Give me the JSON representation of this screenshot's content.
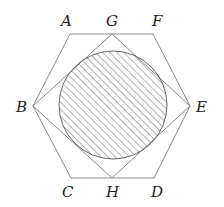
{
  "diagram": {
    "type": "geometry",
    "colors": {
      "line": "#8a8a8a",
      "circle_stroke": "#666666",
      "hatch": "#555555",
      "label": "#222222"
    },
    "points": {
      "A": {
        "label": "A",
        "x": 70,
        "y": 34
      },
      "G": {
        "label": "G",
        "x": 112,
        "y": 34
      },
      "F": {
        "label": "F",
        "x": 153,
        "y": 34
      },
      "E": {
        "label": "E",
        "x": 190,
        "y": 106
      },
      "D": {
        "label": "D",
        "x": 154,
        "y": 178
      },
      "H": {
        "label": "H",
        "x": 112,
        "y": 178
      },
      "C": {
        "label": "C",
        "x": 71,
        "y": 178
      },
      "B": {
        "label": "B",
        "x": 33,
        "y": 106
      }
    },
    "hexagon": [
      "A",
      "F",
      "E",
      "D",
      "C",
      "B"
    ],
    "square": [
      "G",
      "E",
      "H",
      "B"
    ],
    "circle": {
      "cx": 113,
      "cy": 105,
      "r": 54,
      "fill": "hatched"
    }
  }
}
